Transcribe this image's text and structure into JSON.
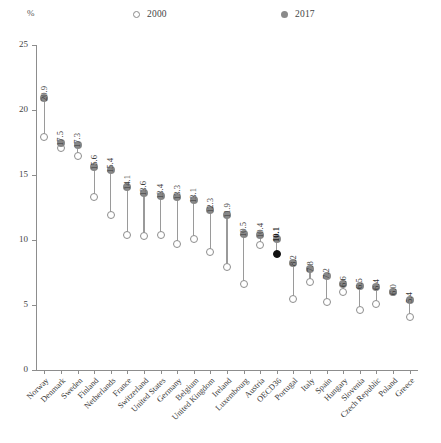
{
  "axis": {
    "unit_label": "%",
    "y_ticks": [
      25,
      20,
      15,
      10,
      5,
      0
    ],
    "y_min": 0,
    "y_max": 25
  },
  "legend": [
    {
      "key": "2000",
      "label": "2000",
      "marker": "open-circle-icon"
    },
    {
      "key": "2017",
      "label": "2017",
      "marker": "filled-circle-icon"
    }
  ],
  "chart_data": {
    "type": "scatter",
    "title": "",
    "subtitle": "",
    "xlabel": "",
    "ylabel": "%",
    "ylim": [
      0,
      25
    ],
    "grid": false,
    "legend_position": "top",
    "categories": [
      "Norway",
      "Denmark",
      "Sweden",
      "Finland",
      "Netherlands",
      "France",
      "Switzerland",
      "United States",
      "Germany",
      "Belgium",
      "United Kingdom",
      "Ireland",
      "Luxembourg",
      "Austria",
      "OECD36",
      "Portugal",
      "Italy",
      "Spain",
      "Hungary",
      "Slovenia",
      "Czech Republic",
      "Poland",
      "Greece"
    ],
    "series": [
      {
        "name": "2017",
        "marker": "filled-circle",
        "color": "#878787",
        "values": [
          20.9,
          17.5,
          17.3,
          15.6,
          15.4,
          14.1,
          13.6,
          13.4,
          13.3,
          13.1,
          12.3,
          11.9,
          10.5,
          10.4,
          10.1,
          8.2,
          7.8,
          7.2,
          6.6,
          6.5,
          6.4,
          6.0,
          5.4
        ],
        "labels": [
          "20.9",
          "17.5",
          "17.3",
          "15.6",
          "15.4",
          "14.1",
          "13.6",
          "13.4",
          "13.3",
          "13.1",
          "12.3",
          "11.9",
          "10.5",
          "10.4",
          "10.1",
          "8.2",
          "7.8",
          "7.2",
          "6.6",
          "6.5",
          "6.4",
          "6.0",
          "5.4"
        ]
      },
      {
        "name": "2000",
        "marker": "open-circle",
        "color": "#8d8d8d",
        "values": [
          17.9,
          17.1,
          16.5,
          13.3,
          11.9,
          10.4,
          10.3,
          10.4,
          9.7,
          10.1,
          9.1,
          7.9,
          6.6,
          9.6,
          8.9,
          5.5,
          6.8,
          5.2,
          6.0,
          4.6,
          5.1,
          6.0,
          4.1
        ]
      }
    ],
    "highlight": {
      "category": "OECD36",
      "label": "10.1",
      "note": "black-filled 2000 marker and bold value label"
    }
  },
  "colors": {
    "marker_2017": "#878787",
    "marker_2000_stroke": "#8d8d8d",
    "highlight": "#111111",
    "axis": "#8d8d8d",
    "text": "#3a3a3a",
    "background": "#ffffff"
  }
}
